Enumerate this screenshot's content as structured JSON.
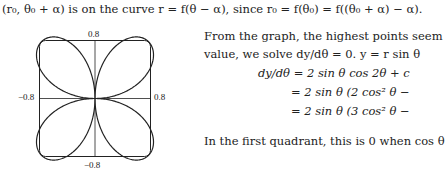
{
  "text_lines": [
    "(r₀, θ₀ + α) is on the curve r = f(θ − α), since r₀ = f(θ₀) = f((θ₀ + α) − α).",
    "From the graph, the highest points seem",
    "value, we solve dy/dθ = 0.  y = r sin θ",
    "dy/dθ = 2 sin θ cos 2θ + c",
    "= 2 sin θ (2 cos² θ −",
    "= 2 sin θ (3 cos² θ −",
    "In the first quadrant, this is 0 when cos θ"
  ],
  "figure": {
    "type": "polar rose",
    "tick_labels": {
      "top": "0.8",
      "bottom": "−0.8",
      "left": "−0.8",
      "right": "0.8"
    },
    "stroke_color": "#222222"
  }
}
